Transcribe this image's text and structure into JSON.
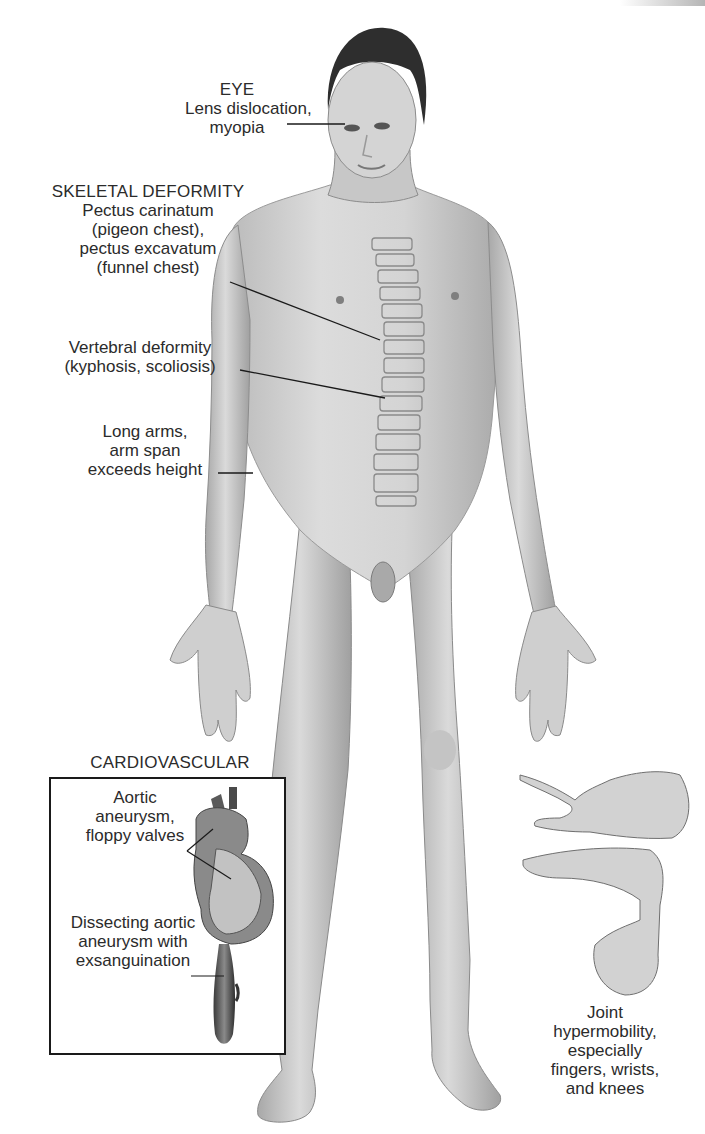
{
  "figure": {
    "labels": {
      "eye": {
        "heading": "EYE",
        "lines": [
          "Lens dislocation,",
          "myopia"
        ]
      },
      "skeletal": {
        "heading": "SKELETAL DEFORMITY",
        "lines": [
          "Pectus carinatum",
          "(pigeon chest),",
          "pectus excavatum",
          "(funnel chest)"
        ]
      },
      "vertebral": {
        "lines": [
          "Vertebral deformity",
          "(kyphosis, scoliosis)"
        ]
      },
      "arms": {
        "lines": [
          "Long arms,",
          "arm span",
          "exceeds height"
        ]
      },
      "cardiovascular": {
        "heading": "CARDIOVASCULAR",
        "aortic": [
          "Aortic",
          "aneurysm,",
          "floppy valves"
        ],
        "dissecting": [
          "Dissecting aortic",
          "aneurysm with",
          "exsanguination"
        ]
      },
      "joint": {
        "lines": [
          "Joint",
          "hypermobility,",
          "especially",
          "fingers, wrists,",
          "and knees"
        ]
      }
    },
    "colors": {
      "background": "#ffffff",
      "text": "#2b2b2b",
      "skin_light": "#d9d9d9",
      "skin_mid": "#bdbdbd",
      "skin_dark": "#8c8c8c",
      "hair": "#2e2e2e",
      "leader_line": "#1a1a1a",
      "box_border": "#1a1a1a"
    }
  }
}
